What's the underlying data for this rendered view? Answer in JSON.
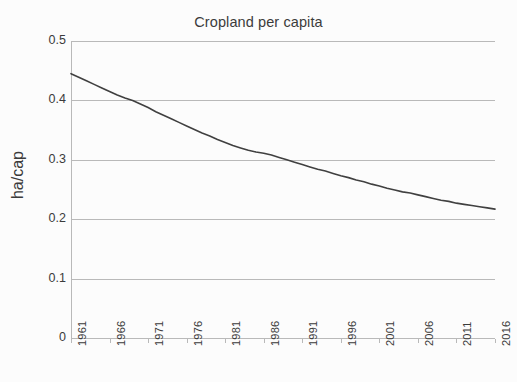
{
  "chart_data": {
    "type": "line",
    "title": "Cropland per capita",
    "xlabel": "",
    "ylabel": "ha/cap",
    "xlim": [
      1961,
      2016
    ],
    "ylim": [
      0,
      0.5
    ],
    "grid": true,
    "legend": false,
    "y_ticks": [
      "0",
      "0.1",
      "0.2",
      "0.3",
      "0.4",
      "0.5"
    ],
    "y_tick_values": [
      0,
      0.1,
      0.2,
      0.3,
      0.4,
      0.5
    ],
    "x_ticks": [
      "1961",
      "1966",
      "1971",
      "1976",
      "1981",
      "1986",
      "1991",
      "1996",
      "2001",
      "2006",
      "2011",
      "2016"
    ],
    "x_tick_values": [
      1961,
      1966,
      1971,
      1976,
      1981,
      1986,
      1991,
      1996,
      2001,
      2006,
      2011,
      2016
    ],
    "series": [
      {
        "name": "Cropland per capita",
        "color": "#404040",
        "x": [
          1961,
          1962,
          1963,
          1964,
          1965,
          1966,
          1967,
          1968,
          1969,
          1970,
          1971,
          1972,
          1973,
          1974,
          1975,
          1976,
          1977,
          1978,
          1979,
          1980,
          1981,
          1982,
          1983,
          1984,
          1985,
          1986,
          1987,
          1988,
          1989,
          1990,
          1991,
          1992,
          1993,
          1994,
          1995,
          1996,
          1997,
          1998,
          1999,
          2000,
          2001,
          2002,
          2003,
          2004,
          2005,
          2006,
          2007,
          2008,
          2009,
          2010,
          2011,
          2012,
          2013,
          2014,
          2015,
          2016
        ],
        "values": [
          0.445,
          0.439,
          0.433,
          0.427,
          0.421,
          0.415,
          0.409,
          0.404,
          0.4,
          0.394,
          0.388,
          0.381,
          0.375,
          0.369,
          0.363,
          0.357,
          0.351,
          0.345,
          0.34,
          0.334,
          0.329,
          0.324,
          0.32,
          0.316,
          0.313,
          0.311,
          0.308,
          0.304,
          0.3,
          0.296,
          0.292,
          0.288,
          0.284,
          0.281,
          0.277,
          0.273,
          0.27,
          0.266,
          0.263,
          0.259,
          0.256,
          0.252,
          0.249,
          0.246,
          0.244,
          0.241,
          0.238,
          0.235,
          0.232,
          0.23,
          0.227,
          0.225,
          0.223,
          0.221,
          0.219,
          0.217
        ]
      }
    ]
  },
  "colors": {
    "line": "#404040",
    "grid": "#b9b9b9",
    "text": "#3b3b3b",
    "background": "#fcfcfc"
  }
}
